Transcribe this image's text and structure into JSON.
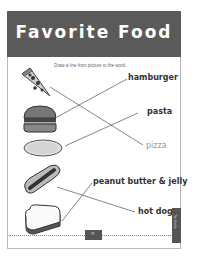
{
  "worksheet": {
    "title": "Favorite Food",
    "instructions": "Draw a line from picture to the word.",
    "pictures": [
      {
        "name": "pizza",
        "icon": "pizza-slice-icon"
      },
      {
        "name": "hamburger",
        "icon": "hamburger-icon"
      },
      {
        "name": "pasta",
        "icon": "pasta-plate-icon"
      },
      {
        "name": "hot dog",
        "icon": "hot-dog-icon"
      },
      {
        "name": "peanut butter & jelly",
        "icon": "sandwich-icon"
      }
    ],
    "words": [
      {
        "label": "hamburger",
        "style": "bold"
      },
      {
        "label": "pasta",
        "style": "bold"
      },
      {
        "label": "pizza",
        "style": "light"
      },
      {
        "label": "peanut butter & jelly",
        "style": "bold"
      },
      {
        "label": "hot dog",
        "style": "bold"
      }
    ],
    "matches": [
      {
        "picture": "pizza",
        "word": "pizza"
      },
      {
        "picture": "hamburger",
        "word": "hamburger"
      },
      {
        "picture": "pasta",
        "word": "pasta"
      },
      {
        "picture": "hot dog",
        "word": "hot dog"
      },
      {
        "picture": "peanut butter & jelly",
        "word": "peanut butter & jelly"
      }
    ],
    "side_tab_label": "Tar Heels",
    "page_number_label": "pg"
  },
  "colors": {
    "header_bg": "#5a5a5a",
    "header_text": "#ffffff",
    "line_color": "#666666",
    "word_text": "#333333",
    "word_light": "#999999"
  }
}
